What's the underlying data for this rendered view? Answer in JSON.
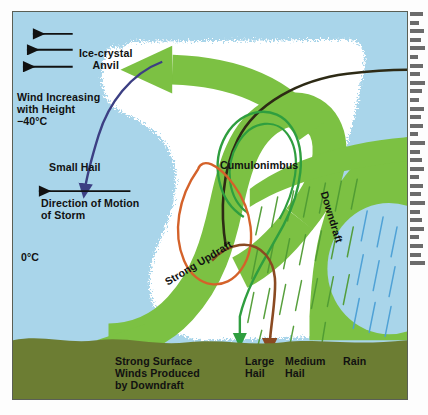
{
  "figure": {
    "kind": "thunderstorm-cross-section-diagram"
  },
  "labels": {
    "ice_crystal_anvil": "Ice-crystal\nAnvil",
    "wind_increasing": "Wind Increasing\nwith Height\n−40°C",
    "small_hail": "Small Hail",
    "direction_of_motion": "Direction of Motion\nof Storm",
    "freezing_level": "0°C",
    "cumulonimbus": "Cumulonimbus",
    "strong_updraft": "Strong Updraft",
    "downdraft": "Downdraft",
    "strong_surface_winds": "Strong Surface\nWinds Produced\nby Downdraft",
    "large_hail": "Large\nHail",
    "medium_hail": "Medium\nHail",
    "rain": "Rain"
  },
  "colors": {
    "sky": "#a9d5ea",
    "cloud": "#ffffff",
    "ground": "#6c7d33",
    "airflow_green": "#7cc143",
    "updraft_trajectory": "#2f9e3f",
    "hail_trajectory_orange": "#d4622a",
    "hail_trajectory_brown": "#8a4a22",
    "anvil_trajectory_dark": "#2d2a15",
    "small_hail_trajectory": "#3c3f83",
    "rain_streak_blue": "#4b9fd5",
    "rain_streak_green": "#4f9b33",
    "frame": "#5a5f55",
    "text": "#111111"
  },
  "arrows": {
    "wind_shear": [
      {
        "name": "wind-arrow-top",
        "length_px": 38
      },
      {
        "name": "wind-arrow-middle",
        "length_px": 46
      },
      {
        "name": "wind-arrow-bottom",
        "length_px": 54
      }
    ],
    "storm_motion": {
      "name": "storm-motion-arrow",
      "direction": "left",
      "length_px": 86
    }
  }
}
